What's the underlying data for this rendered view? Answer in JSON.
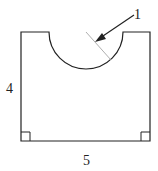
{
  "diagram": {
    "labels": {
      "radius_pointer": "1",
      "height": "4",
      "width": "5"
    },
    "shape": "rectangle with semicircular notch cut from top edge",
    "colors": {
      "stroke": "#222222",
      "radius_line": "#999999"
    }
  }
}
